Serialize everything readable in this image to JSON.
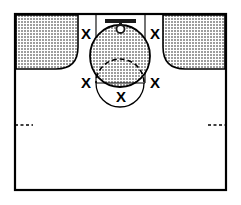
{
  "diagram": {
    "type": "basketball-halfcourt-play-diagram",
    "background_color": "#ffffff",
    "line_color": "#000000",
    "shade_color": "#b3b3b3",
    "court": {
      "border_label": "court-boundary",
      "x": 14,
      "y": 13,
      "width": 213,
      "height": 178,
      "stroke_width": 2
    },
    "hoop": {
      "backboard_label": "backboard",
      "rim_label": "rim",
      "backboard_x": 120,
      "backboard_y": 20,
      "backboard_width": 31,
      "backboard_height": 4,
      "rim_cx": 120,
      "rim_cy": 28,
      "rim_r": 4
    },
    "lane": {
      "label": "free-throw-lane",
      "left_x": 96,
      "right_x": 145,
      "top_y": 13,
      "bottom_y": 83
    },
    "free_throw_line": {
      "label": "free-throw-line",
      "y": 83,
      "x1": 96,
      "x2": 145
    },
    "free_throw_circle": {
      "label": "free-throw-circle",
      "cx": 120,
      "cy": 83,
      "rx": 24,
      "ry": 24,
      "upper_half_style": "dashed",
      "lower_half_style": "solid"
    },
    "shaded_zone": {
      "label": "key-shaded-zone",
      "cx": 120,
      "cy": 56,
      "rx": 30,
      "ry": 31
    },
    "corner_zones": [
      {
        "label": "left-corner-shaded-zone",
        "side": "left",
        "x": 16,
        "y": 15,
        "width": 62,
        "height": 54,
        "corner_radius": 22,
        "rounded_corner": "bottom-right"
      },
      {
        "label": "right-corner-shaded-zone",
        "side": "right",
        "x": 163,
        "y": 15,
        "width": 62,
        "height": 54,
        "corner_radius": 22,
        "rounded_corner": "bottom-left"
      }
    ],
    "hash_marks": [
      {
        "label": "left-sideline-hash",
        "side": "left",
        "x1": 15,
        "x2": 33,
        "y": 125,
        "style": "dashed"
      },
      {
        "label": "right-sideline-hash",
        "side": "right",
        "x1": 208,
        "x2": 226,
        "y": 125,
        "style": "dashed"
      }
    ],
    "player_markers": [
      {
        "label": "X",
        "name": "player-marker-left-wing",
        "x": 86,
        "y": 33
      },
      {
        "label": "X",
        "name": "player-marker-right-wing",
        "x": 155,
        "y": 33
      },
      {
        "label": "X",
        "name": "player-marker-left-elbow",
        "x": 86,
        "y": 82
      },
      {
        "label": "X",
        "name": "player-marker-right-elbow",
        "x": 155,
        "y": 82
      },
      {
        "label": "X",
        "name": "player-marker-top-key",
        "x": 121,
        "y": 96
      }
    ]
  }
}
